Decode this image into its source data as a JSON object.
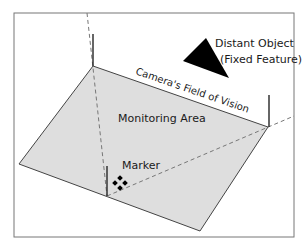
{
  "diagram": {
    "labels": {
      "distant_object": "Distant Object",
      "fixed_feature": "(Fixed Feature)",
      "field_of_vision": "Camera's Field of Vision",
      "monitoring_area": "Monitoring Area",
      "marker": "Marker"
    },
    "colors": {
      "plane_fill": "#dedede",
      "line": "#444444",
      "dash": "#777777",
      "object": "#000000"
    }
  }
}
